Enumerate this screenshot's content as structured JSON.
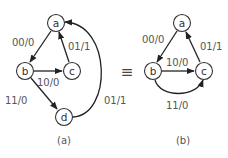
{
  "diagram_a": {
    "caption": "(a)",
    "nodes": [
      {
        "id": "a",
        "label": "a"
      },
      {
        "id": "b",
        "label": "b"
      },
      {
        "id": "c",
        "label": "c"
      },
      {
        "id": "d",
        "label": "d"
      }
    ],
    "edges": [
      {
        "from": "a",
        "to": "b",
        "label": "00/0"
      },
      {
        "from": "c",
        "to": "a",
        "label": "01/1"
      },
      {
        "from": "b",
        "to": "c",
        "label": "10/0"
      },
      {
        "from": "b",
        "to": "d",
        "label": "11/0"
      },
      {
        "from": "d",
        "to": "a",
        "label": "01/1"
      }
    ]
  },
  "equivalence_symbol": "≡",
  "diagram_b": {
    "caption": "(b)",
    "nodes": [
      {
        "id": "a",
        "label": "a"
      },
      {
        "id": "b",
        "label": "b"
      },
      {
        "id": "c",
        "label": "c"
      }
    ],
    "edges": [
      {
        "from": "a",
        "to": "b",
        "label": "00/0"
      },
      {
        "from": "c",
        "to": "a",
        "label": "01/1"
      },
      {
        "from": "b",
        "to": "c",
        "label": "10/0"
      },
      {
        "from": "b",
        "to": "c",
        "label": "11/0"
      }
    ]
  },
  "colors": {
    "stroke": "#222222",
    "text": "#555555",
    "background": "#ffffff"
  }
}
